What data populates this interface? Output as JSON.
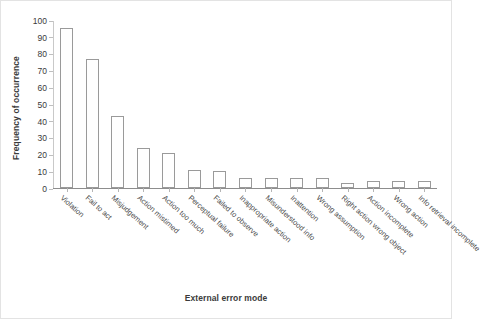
{
  "chart_data": {
    "type": "bar",
    "title": "",
    "xlabel": "External error mode",
    "ylabel": "Frequency of occurrence",
    "ylim": [
      0,
      100
    ],
    "yticks": [
      0,
      10,
      20,
      30,
      40,
      50,
      60,
      70,
      80,
      90,
      100
    ],
    "grid": false,
    "legend": null,
    "bar_style": {
      "fill": "#ffffff",
      "edge": "#9a9a9a"
    },
    "categories": [
      "Violation",
      "Fail to act",
      "Misjudgement",
      "Action mistimed",
      "Action too much",
      "Perceptual failure",
      "Failed to observe",
      "Inappropriate action",
      "Misunderstood info",
      "Inattention",
      "Wrong assumption",
      "Right action wrong object",
      "Action incomplete",
      "Wrong action",
      "Info retrieval incomplete"
    ],
    "values": [
      95,
      77,
      43,
      24,
      21,
      11,
      10,
      6,
      6,
      6,
      6,
      3,
      4,
      4,
      4
    ]
  },
  "axes": {
    "y_title": "Frequency of occurrence",
    "x_title": "External error mode"
  }
}
